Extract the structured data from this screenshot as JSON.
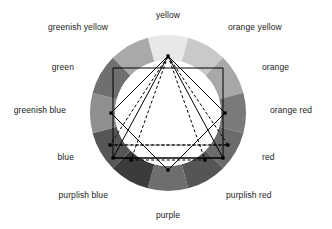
{
  "figure": {
    "name": "twelve-hue-color-circle-with-harmony-geometry",
    "geometry": {
      "center": {
        "x": 168,
        "y": 113
      },
      "outer_radius": 78,
      "inner_radius": 53,
      "segments": 12
    }
  },
  "chart_data": {
    "type": "pie",
    "title": "",
    "xlabel": "",
    "ylabel": "",
    "legend_position": "around-ring",
    "grid": false,
    "categories": [
      "yellow",
      "orange yellow",
      "orange",
      "orange red",
      "red",
      "purplish red",
      "purple",
      "purplish blue",
      "blue",
      "greenish blue",
      "green",
      "greenish yellow"
    ],
    "values": [
      30,
      30,
      30,
      30,
      30,
      30,
      30,
      30,
      30,
      30,
      30,
      30
    ],
    "slice_colors": [
      "#e8e8e8",
      "#c9c9c9",
      "#a8a8a8",
      "#7a7a7a",
      "#6b6b6b",
      "#555555",
      "#6e6e6e",
      "#3b3b3b",
      "#565656",
      "#8f8f8f",
      "#6f6f6f",
      "#a9a9a9"
    ],
    "slice_start_angles_deg": [
      -15,
      15,
      45,
      75,
      105,
      135,
      165,
      195,
      225,
      255,
      285,
      315
    ]
  },
  "wheel": {
    "labels": [
      {
        "id": "yellow",
        "text": "yellow",
        "x": 168,
        "y": 10,
        "align": "center"
      },
      {
        "id": "orange-yellow",
        "text": "orange yellow",
        "x": 228,
        "y": 22,
        "align": "left"
      },
      {
        "id": "orange",
        "text": "orange",
        "x": 262,
        "y": 62,
        "align": "left"
      },
      {
        "id": "orange-red",
        "text": "orange red",
        "x": 270,
        "y": 105,
        "align": "left"
      },
      {
        "id": "red",
        "text": "red",
        "x": 262,
        "y": 152,
        "align": "left"
      },
      {
        "id": "purplish-red",
        "text": "purplish red",
        "x": 226,
        "y": 190,
        "align": "left"
      },
      {
        "id": "purple",
        "text": "purple",
        "x": 168,
        "y": 210,
        "align": "center"
      },
      {
        "id": "purplish-blue",
        "text": "purplish blue",
        "x": 108,
        "y": 190,
        "align": "right"
      },
      {
        "id": "blue",
        "text": "blue",
        "x": 74,
        "y": 152,
        "align": "right"
      },
      {
        "id": "greenish-blue",
        "text": "greenish blue",
        "x": 66,
        "y": 105,
        "align": "right"
      },
      {
        "id": "green",
        "text": "green",
        "x": 74,
        "y": 62,
        "align": "right"
      },
      {
        "id": "greenish-yellow",
        "text": "greenish yellow",
        "x": 108,
        "y": 22,
        "align": "right"
      }
    ],
    "segment_fills": [
      "#e8e8e8",
      "#c9c9c9",
      "#a8a8a8",
      "#7a7a7a",
      "#6b6b6b",
      "#555555",
      "#6e6e6e",
      "#3b3b3b",
      "#565656",
      "#8f8f8f",
      "#6f6f6f",
      "#a9a9a9"
    ],
    "inner_disc_color": "#ffffff",
    "line_color": "#000000",
    "background_color": "#ffffff"
  },
  "overlays": {
    "square": {
      "name": "harmony-square",
      "style": "solid",
      "points": "168,56 225,113 168,170 111,113"
    },
    "rectangle": {
      "name": "harmony-rectangle",
      "style": "solid",
      "points": "113,68 223,68 223,158 113,158"
    },
    "triangle_solid": {
      "name": "harmony-triangle-solid",
      "style": "solid",
      "points": "168,56 223,158 113,158"
    },
    "triangle_dashed_a": {
      "name": "harmony-triangle-dashed-wide",
      "style": "dashed",
      "points": "168,56 228,145 110,145"
    },
    "triangle_dashed_b": {
      "name": "harmony-triangle-dashed-narrow",
      "style": "dashed",
      "points": "168,56 205,160 131,160"
    },
    "dashed_chord": {
      "name": "dashed-horizontal-chord",
      "style": "dashed",
      "points": "110,145 228,145"
    },
    "vertices": [
      {
        "name": "vertex-top",
        "x": 168,
        "y": 56
      },
      {
        "name": "vertex-right",
        "x": 225,
        "y": 113
      },
      {
        "name": "vertex-bottom",
        "x": 168,
        "y": 170
      },
      {
        "name": "vertex-left",
        "x": 111,
        "y": 113
      },
      {
        "name": "vertex-rect-bl",
        "x": 113,
        "y": 158
      },
      {
        "name": "vertex-rect-br",
        "x": 223,
        "y": 158
      },
      {
        "name": "vertex-dash-l",
        "x": 110,
        "y": 145
      },
      {
        "name": "vertex-dash-r",
        "x": 228,
        "y": 145
      },
      {
        "name": "vertex-dash-bl",
        "x": 131,
        "y": 160
      },
      {
        "name": "vertex-dash-br",
        "x": 205,
        "y": 160
      }
    ]
  }
}
